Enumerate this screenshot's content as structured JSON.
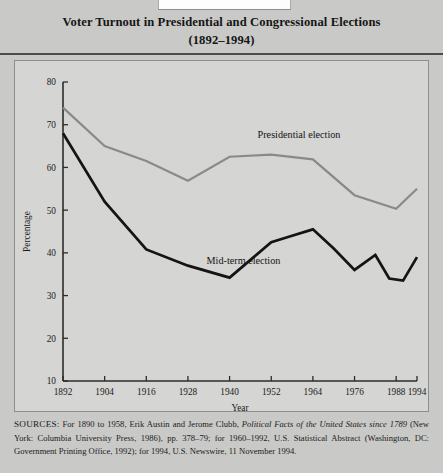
{
  "figure": {
    "title_line1": "Voter Turnout in Presidential and Congressional Elections",
    "title_line2": "(1892–1994)",
    "background_color": "#c9c9c7",
    "panel_color": "#d5d5d3"
  },
  "chart_data": {
    "type": "line",
    "title": "Voter Turnout in Presidential and Congressional Elections (1892–1994)",
    "xlabel": "Year",
    "ylabel": "Percentage",
    "xlim": [
      1892,
      1994
    ],
    "ylim": [
      10,
      80
    ],
    "ytick_labels": [
      "10",
      "20",
      "30",
      "40",
      "50",
      "60",
      "70",
      "80"
    ],
    "yticks": [
      10,
      20,
      30,
      40,
      50,
      60,
      70,
      80
    ],
    "xtick_labels": [
      "1892",
      "1904",
      "1916",
      "1928",
      "1940",
      "1952",
      "1964",
      "1976",
      "1988",
      "1994"
    ],
    "xticks": [
      1892,
      1904,
      1916,
      1928,
      1940,
      1952,
      1964,
      1976,
      1988,
      1994
    ],
    "grid": false,
    "legend_position": "inline-annotations",
    "series": [
      {
        "name": "Presidential election",
        "color": "#8a8a88",
        "x": [
          1892,
          1904,
          1916,
          1928,
          1940,
          1952,
          1964,
          1976,
          1988,
          1994
        ],
        "values": [
          74,
          65,
          61.5,
          56.9,
          62.5,
          63,
          61.9,
          53.5,
          50.3,
          55
        ]
      },
      {
        "name": "Mid-term election",
        "color": "#141414",
        "x": [
          1892,
          1904,
          1916,
          1928,
          1940,
          1952,
          1958,
          1964,
          1970,
          1976,
          1982,
          1986,
          1990,
          1994
        ],
        "values": [
          68,
          52,
          40.8,
          37,
          34.2,
          42.5,
          44,
          45.5,
          41,
          36,
          39.5,
          34,
          33.5,
          39
        ]
      }
    ],
    "annotations": [
      {
        "text": "Presidential election",
        "x": 1960,
        "y": 67
      },
      {
        "text": "Mid-term election",
        "x": 1944,
        "y": 37.5
      }
    ]
  },
  "source_note": {
    "prefix": "SOURCES:",
    "part1": " For 1890 to 1958, Erik Austin and Jerome Clubb, ",
    "italic1": "Political Facts of the United States since 1789",
    "part2": " (New York: Columbia University Press, 1986), pp. 378–79; for 1960–1992, U.S. Statistical Abstract (Washington, DC: Government Printing Office, 1992); for 1994, U.S. Newswire, 11 November 1994."
  }
}
